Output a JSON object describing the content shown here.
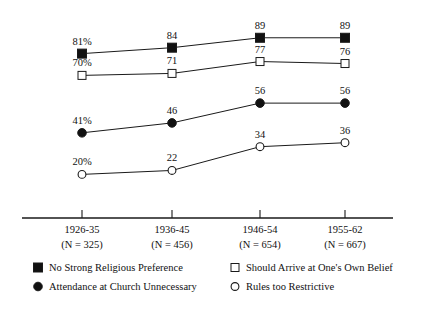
{
  "chart_data": {
    "type": "line",
    "title": "",
    "subtitle": "",
    "xlabel": "",
    "ylabel": "",
    "grid": false,
    "ylim": [
      0,
      100
    ],
    "legend_position": "bottom",
    "categories": [
      "1926-35",
      "1936-45",
      "1946-54",
      "1955-62"
    ],
    "category_sublabels": [
      "(N = 325)",
      "(N = 456)",
      "(N = 654)",
      "(N = 667)"
    ],
    "series": [
      {
        "name": "No Strong Religious Preference",
        "marker": "filled-square",
        "values": [
          81,
          84,
          89,
          89
        ],
        "point_labels": [
          "81%",
          "84",
          "89",
          "89"
        ]
      },
      {
        "name": "Should Arrive at One's Own Belief",
        "marker": "open-square",
        "values": [
          70,
          71,
          77,
          76
        ],
        "point_labels": [
          "70%",
          "71",
          "77",
          "76"
        ]
      },
      {
        "name": "Attendance at Church Unnecessary",
        "marker": "filled-circle",
        "values": [
          41,
          46,
          56,
          56
        ],
        "point_labels": [
          "41%",
          "46",
          "56",
          "56"
        ]
      },
      {
        "name": "Rules too Restrictive",
        "marker": "open-circle",
        "values": [
          20,
          22,
          34,
          36
        ],
        "point_labels": [
          "20%",
          "22",
          "34",
          "36"
        ]
      }
    ],
    "colors": {
      "ink": "#1a1a1a",
      "marker_fill": "#111111",
      "marker_open_fill": "#ffffff",
      "background": "#ffffff"
    }
  },
  "legend": {
    "entries": [
      {
        "label": "No Strong Religious Preference",
        "marker": "filled-square",
        "column": 0,
        "row": 0
      },
      {
        "label": "Attendance at Church Unnecessary",
        "marker": "filled-circle",
        "column": 0,
        "row": 1
      },
      {
        "label": "Should Arrive at One's Own Belief",
        "marker": "open-square",
        "column": 1,
        "row": 0
      },
      {
        "label": "Rules too Restrictive",
        "marker": "open-circle",
        "column": 1,
        "row": 1
      }
    ]
  }
}
